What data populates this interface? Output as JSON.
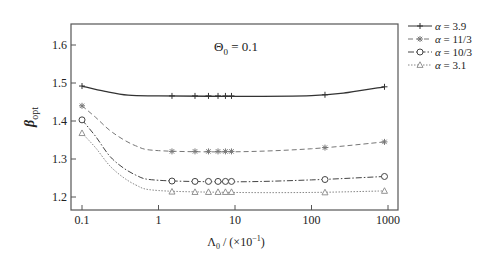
{
  "chart_data": {
    "type": "line",
    "title": "",
    "annotation": "Θ0 = 0.1",
    "xlabel": "Λ0 / (×10⁻¹)",
    "ylabel": "β opt",
    "xscale": "log",
    "xlim": [
      0.07,
      1200
    ],
    "ylim": [
      1.15,
      1.67
    ],
    "xticks": [
      0.1,
      1,
      10,
      100,
      1000
    ],
    "xtick_labels": [
      "0.1",
      "1",
      "10",
      "100",
      "1000"
    ],
    "yticks": [
      1.2,
      1.3,
      1.4,
      1.5,
      1.6
    ],
    "ytick_labels": [
      "1.2",
      "1.3",
      "1.4",
      "1.5",
      "1.6"
    ],
    "grid": false,
    "legend_position": "outside-right-top",
    "x": [
      0.1,
      1.5,
      3,
      4.5,
      6,
      7.5,
      9,
      150,
      900
    ],
    "series": [
      {
        "name": "α = 3.9",
        "marker": "plus",
        "linestyle": "solid",
        "color": "#333333",
        "values": [
          1.492,
          1.466,
          1.466,
          1.466,
          1.466,
          1.466,
          1.466,
          1.469,
          1.49
        ],
        "curve": [
          [
            0.1,
            1.492
          ],
          [
            0.2,
            1.478
          ],
          [
            0.4,
            1.468
          ],
          [
            1,
            1.466
          ],
          [
            10,
            1.465
          ],
          [
            100,
            1.467
          ],
          [
            300,
            1.475
          ],
          [
            900,
            1.49
          ]
        ]
      },
      {
        "name": "α = 11/3",
        "marker": "asterisk",
        "linestyle": "dashed",
        "color": "#777777",
        "values": [
          1.44,
          1.32,
          1.32,
          1.32,
          1.32,
          1.32,
          1.32,
          1.33,
          1.345
        ],
        "curve": [
          [
            0.1,
            1.44
          ],
          [
            0.15,
            1.41
          ],
          [
            0.25,
            1.37
          ],
          [
            0.5,
            1.335
          ],
          [
            1,
            1.322
          ],
          [
            10,
            1.319
          ],
          [
            100,
            1.327
          ],
          [
            900,
            1.345
          ]
        ]
      },
      {
        "name": "α = 10/3",
        "marker": "circle",
        "linestyle": "dashdot",
        "color": "#444444",
        "values": [
          1.403,
          1.242,
          1.241,
          1.241,
          1.241,
          1.241,
          1.241,
          1.246,
          1.254
        ],
        "curve": [
          [
            0.1,
            1.403
          ],
          [
            0.15,
            1.36
          ],
          [
            0.25,
            1.3
          ],
          [
            0.5,
            1.258
          ],
          [
            1,
            1.244
          ],
          [
            10,
            1.24
          ],
          [
            100,
            1.245
          ],
          [
            900,
            1.254
          ]
        ]
      },
      {
        "name": "α = 3.1",
        "marker": "triangle",
        "linestyle": "dotted",
        "color": "#888888",
        "values": [
          1.368,
          1.214,
          1.213,
          1.213,
          1.213,
          1.213,
          1.213,
          1.212,
          1.216
        ],
        "curve": [
          [
            0.1,
            1.368
          ],
          [
            0.15,
            1.33
          ],
          [
            0.25,
            1.275
          ],
          [
            0.5,
            1.232
          ],
          [
            1,
            1.217
          ],
          [
            10,
            1.212
          ],
          [
            100,
            1.212
          ],
          [
            900,
            1.216
          ]
        ]
      }
    ]
  },
  "legend": {
    "items": [
      "α = 3.9",
      "α = 11/3",
      "α = 10/3",
      "α = 3.1"
    ]
  },
  "annotation": {
    "theta": "Θ",
    "sub": "0",
    "rest": " = 0.1"
  },
  "axes": {
    "ylabel_main": "β",
    "ylabel_sub": "opt",
    "xlabel_main": "Λ",
    "xlabel_sub": "0",
    "xlabel_rest": " / (×10",
    "xlabel_exp": "−1",
    "xlabel_close": ")"
  }
}
